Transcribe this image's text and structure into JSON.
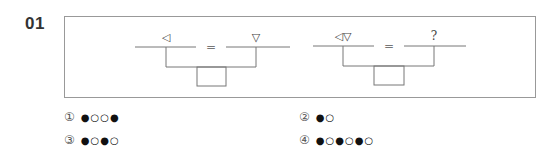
{
  "question": {
    "number": "01",
    "equations": [
      {
        "left": "◁",
        "equals": "=",
        "right": "▽"
      },
      {
        "left": "◁▽",
        "equals": "=",
        "right": "?"
      }
    ]
  },
  "options": [
    {
      "marker": "①",
      "sequence": "●○○●"
    },
    {
      "marker": "②",
      "sequence": "●○"
    },
    {
      "marker": "③",
      "sequence": "●○●○"
    },
    {
      "marker": "④",
      "sequence": "●○●○●○"
    }
  ]
}
